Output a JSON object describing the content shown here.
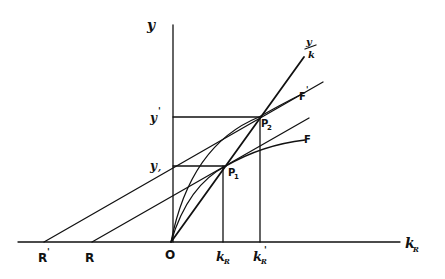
{
  "diagram": {
    "type": "economics-production-function",
    "colors": {
      "ink": "#111111",
      "background": "#ffffff"
    },
    "axes": {
      "x_label": "k",
      "x_label_sub": "R",
      "y_label": "y",
      "origin_label": "O"
    },
    "x_axis_labels": [
      {
        "id": "R_prime",
        "text": "R",
        "mark": "'"
      },
      {
        "id": "R",
        "text": "R",
        "mark": ""
      },
      {
        "id": "O",
        "text": "O",
        "mark": ""
      },
      {
        "id": "kR",
        "text": "k",
        "sub": "R",
        "mark": ""
      },
      {
        "id": "kR_prime",
        "text": "k",
        "sub": "R",
        "mark": "'"
      }
    ],
    "y_axis_labels": [
      {
        "id": "y_prime",
        "text": "y",
        "mark": "'"
      },
      {
        "id": "y",
        "text": "y",
        "mark": ","
      }
    ],
    "points": [
      {
        "id": "P1",
        "text": "P",
        "sub": "1"
      },
      {
        "id": "P2",
        "text": "P",
        "sub": "2"
      }
    ],
    "curves": [
      {
        "id": "F",
        "text": "F",
        "mark": ""
      },
      {
        "id": "F_prime",
        "text": "F",
        "mark": "'"
      }
    ],
    "ray": {
      "id": "y_over_k",
      "numerator": "y",
      "denominator": "k"
    }
  }
}
